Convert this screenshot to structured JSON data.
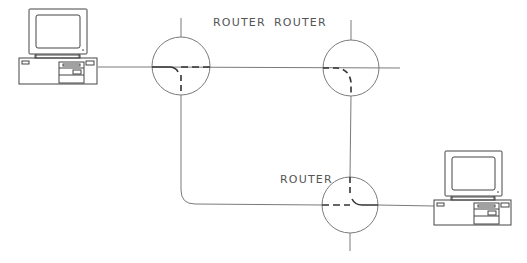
{
  "diagram": {
    "type": "network-topology",
    "line_color": "#777777",
    "routers": [
      {
        "id": "router-top-left",
        "label": "ROUTER",
        "cx": 181,
        "cy": 66,
        "r": 29
      },
      {
        "id": "router-top-right",
        "label": "ROUTER",
        "cx": 351,
        "cy": 68,
        "r": 28
      },
      {
        "id": "router-bottom",
        "label": "ROUTER",
        "cx": 350,
        "cy": 205,
        "r": 28
      }
    ],
    "computers": [
      {
        "id": "computer-left",
        "x": 18,
        "y": 8
      },
      {
        "id": "computer-right",
        "x": 432,
        "y": 150
      }
    ],
    "labels": {
      "router_1": "ROUTER",
      "router_2": "ROUTER",
      "router_3": "ROUTER"
    }
  }
}
